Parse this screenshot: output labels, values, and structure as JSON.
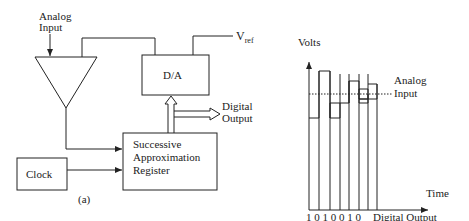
{
  "panel_a": {
    "caption": "(a)",
    "analog_input_label": [
      "Analog",
      "Input"
    ],
    "vref_label": "V",
    "vref_subscript": "ref",
    "dac_label": "D/A",
    "digital_output_label": [
      "Digital",
      "Output"
    ],
    "sar_label": [
      "Successive",
      "Approximation",
      "Register"
    ],
    "clock_label": "Clock"
  },
  "panel_b": {
    "caption": "(b)",
    "y_axis_label": "Volts",
    "x_axis_label": "Time",
    "analog_input_label": [
      "Analog",
      "Input"
    ],
    "bits": "1 0 1 0 0 1 0",
    "digital_output_label": "Digital Output"
  },
  "colors": {
    "stroke": "#222222",
    "background": "#ffffff"
  }
}
